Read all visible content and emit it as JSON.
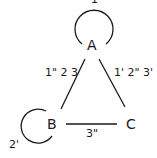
{
  "diagram": {
    "type": "directed-graph",
    "nodes": [
      {
        "id": "A",
        "label": "A"
      },
      {
        "id": "B",
        "label": "B"
      },
      {
        "id": "C",
        "label": "C"
      }
    ],
    "edges": [
      {
        "from": "A",
        "to": "A",
        "label": "1",
        "kind": "self-loop"
      },
      {
        "from": "A",
        "to": "B",
        "label": "1\" 2 3"
      },
      {
        "from": "A",
        "to": "C",
        "label": "1' 2\" 3'"
      },
      {
        "from": "B",
        "to": "C",
        "label": "3\""
      },
      {
        "from": "B",
        "to": "B",
        "label": "2'",
        "kind": "self-loop"
      }
    ],
    "colors": {
      "line": "#1a1a1a",
      "background": "#ffffff"
    }
  }
}
